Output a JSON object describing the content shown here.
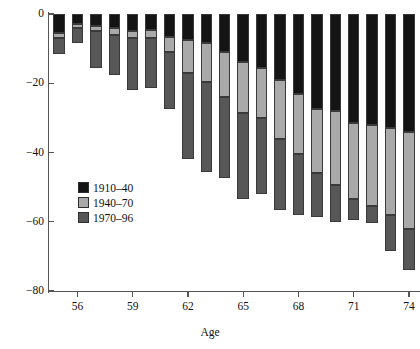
{
  "chart_data": {
    "type": "bar",
    "subtype": "stacked-bar-negative",
    "title": "",
    "xlabel": "Age",
    "ylabel": "",
    "ylim": [
      -80,
      0
    ],
    "xlim": [
      54.4,
      74.6
    ],
    "yticks": [
      0,
      -20,
      -40,
      -60,
      -80
    ],
    "ytick_labels": [
      "0",
      "−20",
      "−40",
      "−60",
      "−80"
    ],
    "xticks": [
      56,
      59,
      62,
      65,
      68,
      71,
      74
    ],
    "xtick_labels": [
      "56",
      "59",
      "62",
      "65",
      "68",
      "71",
      "74"
    ],
    "grid": false,
    "legend_position": "center-left",
    "categories": [
      55,
      56,
      57,
      58,
      59,
      60,
      61,
      62,
      63,
      64,
      65,
      66,
      67,
      68,
      69,
      70,
      71,
      72,
      73,
      74
    ],
    "series": [
      {
        "name": "1910–40",
        "color": "#141414",
        "values": [
          -5.5,
          -3.0,
          -3.5,
          -4.0,
          -5.0,
          -4.5,
          -6.5,
          -7.5,
          -8.5,
          -11.0,
          -14.0,
          -15.5,
          -19.0,
          -23.0,
          -27.5,
          -28.0,
          -31.5,
          -32.0,
          -33.0,
          -34.0
        ]
      },
      {
        "name": "1940–70",
        "color": "#a9a9a9",
        "values": [
          -1.5,
          -1.0,
          -1.5,
          -2.0,
          -2.0,
          -2.5,
          -4.5,
          -9.5,
          -11.0,
          -13.0,
          -14.5,
          -14.5,
          -17.0,
          -17.5,
          -18.5,
          -21.5,
          -22.0,
          -23.5,
          -25.0,
          -28.0
        ]
      },
      {
        "name": "1970–96",
        "color": "#575757",
        "values": [
          -4.5,
          -4.5,
          -10.5,
          -11.5,
          -15.0,
          -14.5,
          -16.5,
          -25.0,
          -26.0,
          -23.5,
          -25.0,
          -22.0,
          -20.5,
          -17.5,
          -12.5,
          -10.5,
          -6.0,
          -5.0,
          -10.5,
          -12.0
        ]
      }
    ]
  },
  "legend": {
    "entries": [
      {
        "label": "1910–40",
        "color": "#141414"
      },
      {
        "label": "1940–70",
        "color": "#a9a9a9"
      },
      {
        "label": "1970–96",
        "color": "#575757"
      }
    ]
  },
  "axes": {
    "x_title": "Age"
  }
}
